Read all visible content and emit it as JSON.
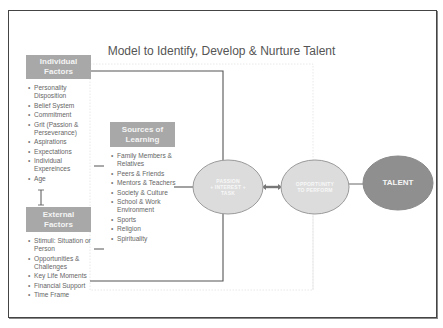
{
  "title": "Model to Identify, Develop & Nurture Talent",
  "individual_factors": {
    "heading_line1": "Individual",
    "heading_line2": "Factors",
    "items": [
      "Personality Disposition",
      "Belief System",
      "Commitment",
      "Grit (Passion & Perseverance)",
      "Aspirations",
      "Expectations",
      "Individual Expereinces",
      "Age"
    ]
  },
  "external_factors": {
    "heading_line1": "External",
    "heading_line2": "Factors",
    "items": [
      "Stimuli: Situation or Person",
      "Opportunities & Challenges",
      "Key Life Moments",
      "Financial Support",
      "Time Frame"
    ]
  },
  "sources_of_learning": {
    "heading_line1": "Sources of",
    "heading_line2": "Learning",
    "items": [
      "Family Members & Relatives",
      "Peers & Friends",
      "Mentors & Teachers",
      "Society & Culture",
      "School & Work Environment",
      "Sports",
      "Religion",
      "Spirituality"
    ]
  },
  "nodes": {
    "passion": {
      "line1": "PASSION",
      "line2": "+ INTEREST +",
      "line3": "TASK"
    },
    "opportunity": {
      "line1": "OPPORTUNITY",
      "line2": "TO PERFORM"
    },
    "talent": {
      "label": "TALENT"
    }
  },
  "colors": {
    "box_fill": "#a8a8a8",
    "ellipse_light": "#d9d9d9",
    "ellipse_dark": "#8f8f8f",
    "connector": "#555555",
    "text": "#666666"
  }
}
